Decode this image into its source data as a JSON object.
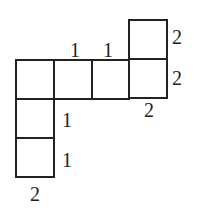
{
  "diagram": {
    "stroke_color": "#222222",
    "background": "#ffffff",
    "cells": [
      {
        "id": "top-right",
        "x": 129,
        "y": 20,
        "w": 38,
        "h": 39
      },
      {
        "id": "row-1",
        "x": 16,
        "y": 60,
        "w": 38,
        "h": 39
      },
      {
        "id": "row-2",
        "x": 54,
        "y": 60,
        "w": 38,
        "h": 39
      },
      {
        "id": "row-3",
        "x": 92,
        "y": 60,
        "w": 37,
        "h": 39
      },
      {
        "id": "row-4",
        "x": 129,
        "y": 59,
        "w": 38,
        "h": 39
      },
      {
        "id": "col-1",
        "x": 16,
        "y": 99,
        "w": 38,
        "h": 39
      },
      {
        "id": "col-2",
        "x": 16,
        "y": 138,
        "w": 38,
        "h": 39
      }
    ],
    "labels": {
      "top_mid_left": "1",
      "top_mid_right": "1",
      "right_upper": "2",
      "right_lower": "2",
      "bottom_right": "2",
      "left_col_upper": "1",
      "left_col_lower": "1",
      "bottom_left": "2"
    }
  }
}
